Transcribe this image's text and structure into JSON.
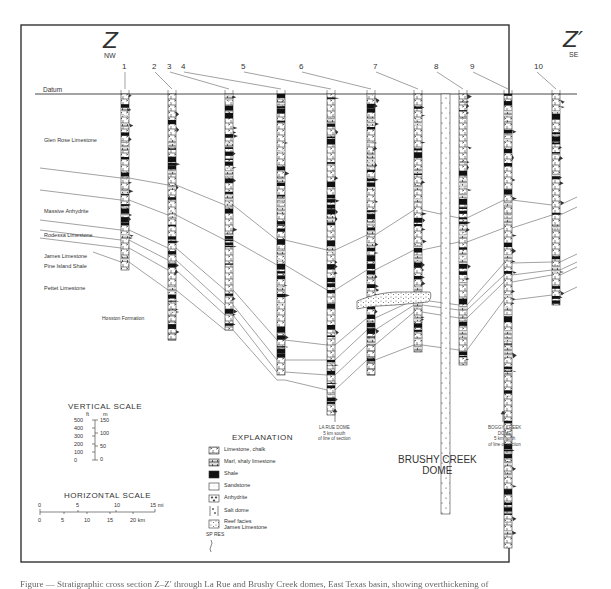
{
  "figure": {
    "left_end": {
      "letter": "Z",
      "direction": "NW"
    },
    "right_end": {
      "letter": "Z′",
      "direction": "SE"
    },
    "datum_label": "Datum",
    "wells": [
      "1",
      "2",
      "3",
      "4",
      "5",
      "6",
      "7",
      "8",
      "9",
      "10"
    ],
    "formations": [
      "Glen Rose Limestone",
      "Massive Anhydrite",
      "Rodessa Limestone",
      "James Limestone",
      "Pine Island Shale",
      "Pettet Limestone",
      "Hosston Formation"
    ],
    "domes": {
      "brushy_creek": {
        "line1": "BRUSHY CREEK",
        "line2": "DOME"
      },
      "la_rue": {
        "line1": "LA RUE DOME",
        "line2": "5 km south",
        "line3": "of line of section"
      },
      "boggy_creek": {
        "line1": "BOGGY CREEK",
        "line2": "DOME",
        "line3": "5 km north",
        "line4": "of line of section"
      }
    },
    "vertical_scale": {
      "title": "VERTICAL SCALE",
      "ft_unit": "ft",
      "m_unit": "m",
      "ft_ticks": [
        "500",
        "400",
        "300",
        "200",
        "100",
        "0"
      ],
      "m_ticks": [
        "150",
        "100",
        "50",
        "0"
      ]
    },
    "horizontal_scale": {
      "title": "HORIZONTAL SCALE",
      "mi_ticks": [
        "0",
        "5",
        "10",
        "15 mi"
      ],
      "km_ticks": [
        "0",
        "5",
        "10",
        "15",
        "20 km"
      ]
    },
    "explanation": {
      "title": "EXPLANATION",
      "items": [
        {
          "label": "Limestone, chalk",
          "pattern": "brick"
        },
        {
          "label": "Marl, shaly limestone",
          "pattern": "brick-dash"
        },
        {
          "label": "Shale",
          "pattern": "solid-black"
        },
        {
          "label": "Sandstone",
          "pattern": "dots"
        },
        {
          "label": "Anhydrite",
          "pattern": "triangles"
        },
        {
          "label": "Salt dome",
          "pattern": "salt"
        },
        {
          "label": "Reef facies\nJames Limestone",
          "pattern": "reef"
        }
      ],
      "log_label": "SP RES"
    },
    "caption": "Figure — Stratigraphic cross section Z–Z′ through La Rue and Brushy Creek domes, East Texas basin, showing overthickening of"
  },
  "colors": {
    "ink": "#1a1a1a",
    "paper": "#ffffff",
    "frame": "#333333"
  }
}
